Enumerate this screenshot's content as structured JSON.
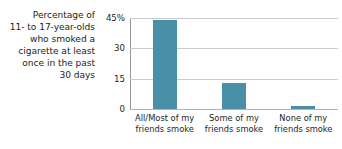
{
  "chart_data": {
    "type": "bar",
    "title": "Percentage of 11- to 17-year-olds who smoked a cigarette at least once in the past 30 days",
    "title_lines": [
      "Percentage of",
      "11- to 17-year-olds",
      "who smoked a",
      "cigarette at least",
      "once in the past",
      "30 days"
    ],
    "categories": [
      "All/Most of my friends smoke",
      "Some of my friends smoke",
      "None of my friends smoke"
    ],
    "category_lines": [
      [
        "All/Most of my",
        "friends smoke"
      ],
      [
        "Some of my",
        "friends smoke"
      ],
      [
        "None of my",
        "friends smoke"
      ]
    ],
    "values": [
      44,
      13,
      1.5
    ],
    "xlabel": "",
    "ylabel": "",
    "ylim": [
      0,
      45
    ],
    "yticks": [
      0,
      15,
      30,
      45
    ],
    "ytick_labels": [
      "0",
      "15",
      "30",
      "45%"
    ],
    "grid": true,
    "legend": false,
    "bar_color": "#4a8fa8",
    "gridline_color": "#c9cdd0",
    "axis_color": "#8f9599",
    "text_color": "#231f20",
    "background": "#ffffff"
  }
}
